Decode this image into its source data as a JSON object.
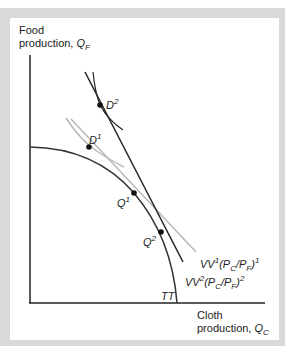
{
  "diagram": {
    "y_axis_label": {
      "line1": "Food",
      "line2": "production, ",
      "var": "Q",
      "sub": "F"
    },
    "x_axis_label": {
      "line1": "Cloth",
      "line2": "production, ",
      "var": "Q",
      "sub": "C"
    },
    "curve_label": "TT",
    "points": [
      {
        "name": "D",
        "sup": "2"
      },
      {
        "name": "D",
        "sup": "1"
      },
      {
        "name": "Q",
        "sup": "1"
      },
      {
        "name": "Q",
        "sup": "2"
      }
    ],
    "isovalue_lines": [
      {
        "name": "VV",
        "sup": "1",
        "ratio": "(P",
        "c": "C",
        "slash": "/P",
        "f": "F",
        "close": ")",
        "exp": "1"
      },
      {
        "name": "VV",
        "sup": "2",
        "ratio": "(P",
        "c": "C",
        "slash": "/P",
        "f": "F",
        "close": ")",
        "exp": "2"
      }
    ],
    "colors": {
      "frame": "#d9d9d9",
      "gray_line": "#b8b8b8",
      "black": "#222222"
    }
  }
}
